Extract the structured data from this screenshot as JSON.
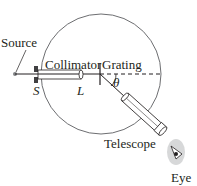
{
  "diagram": {
    "labels": {
      "source": "Source",
      "collimator": "Collimator",
      "grating": "Grating",
      "slit": "S",
      "lens": "L",
      "angle": "θ",
      "telescope": "Telescope",
      "eye": "Eye"
    },
    "colors": {
      "line": "#231f20",
      "circle": "#6d6e71",
      "tube": "#ffffff",
      "eye_shade": "#bcbec0"
    }
  }
}
